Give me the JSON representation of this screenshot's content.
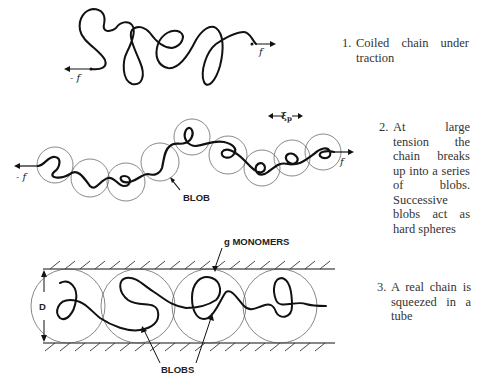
{
  "panels": [
    {
      "id": 1,
      "number": "1.",
      "caption": "Coiled chain under traction",
      "labels": {
        "left_force": "- f",
        "right_force": "f"
      }
    },
    {
      "id": 2,
      "number": "2.",
      "caption": "At large tension the chain breaks up into a series of blobs. Successive blobs act as hard spheres",
      "labels": {
        "left_force": "- f",
        "right_force": "f",
        "blob": "BLOB",
        "length_scale": "ξp"
      }
    },
    {
      "id": 3,
      "number": "3.",
      "caption": "A real chain is squeezed in a tube",
      "labels": {
        "diameter": "D",
        "monomers": "g MONOMERS",
        "blobs": "BLOBS"
      }
    }
  ]
}
